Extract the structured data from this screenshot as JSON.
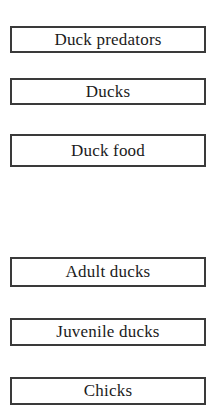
{
  "diagram": {
    "background_color": "#ffffff",
    "box_border_color": "#3a3a3a",
    "text_color": "#1b1b1b",
    "groups": [
      {
        "name": "trophic-level-nodes",
        "nodes": [
          {
            "id": "duck-predators",
            "label": "Duck predators"
          },
          {
            "id": "ducks",
            "label": "Ducks"
          },
          {
            "id": "duck-food",
            "label": "Duck food"
          }
        ]
      },
      {
        "name": "life-stage-nodes",
        "nodes": [
          {
            "id": "adult-ducks",
            "label": "Adult ducks"
          },
          {
            "id": "juvenile-ducks",
            "label": "Juvenile ducks"
          },
          {
            "id": "chicks",
            "label": "Chicks"
          }
        ]
      }
    ]
  }
}
